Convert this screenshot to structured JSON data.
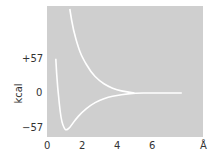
{
  "chart_data": {
    "type": "line",
    "title": "",
    "xlabel": "Å",
    "ylabel": "kcal",
    "xlim": [
      0,
      8.9
    ],
    "ylim": [
      -70,
      140
    ],
    "x_ticks": [
      "0",
      "2",
      "4",
      "6"
    ],
    "y_ticks": [
      "+57",
      "0",
      "−57"
    ],
    "grid": false,
    "background": "#cfcfcf",
    "line_color": "#ffffff",
    "series": [
      {
        "name": "bonding (attractive) potential",
        "x": [
          0.5,
          0.6,
          0.8,
          1.0,
          1.1,
          1.3,
          1.6,
          2.0,
          2.5,
          3.0,
          3.5,
          4.0,
          4.5,
          5.0,
          6.0,
          7.0,
          7.7
        ],
        "y": [
          57,
          10,
          -45,
          -60,
          -62,
          -58,
          -45,
          -32,
          -20,
          -12,
          -7,
          -4,
          -2,
          0,
          0,
          0,
          0
        ]
      },
      {
        "name": "antibonding (repulsive) potential",
        "x": [
          1.3,
          1.5,
          1.8,
          2.0,
          2.5,
          3.0,
          3.5,
          4.0,
          4.5,
          5.0
        ],
        "y": [
          140,
          105,
          75,
          60,
          35,
          20,
          11,
          5,
          2,
          0
        ]
      }
    ]
  },
  "axis": {
    "x_unit": "Å",
    "y_unit": "kcal",
    "x_tick_labels": [
      "0",
      "2",
      "4",
      "6"
    ],
    "y_tick_labels": [
      "+57",
      "0",
      "−57"
    ]
  }
}
